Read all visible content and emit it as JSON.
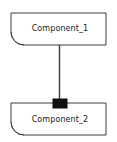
{
  "diagram": {
    "type": "uml-component-diagram",
    "title": "",
    "canvas": {
      "width": 117,
      "height": 142,
      "background": "#ffffff"
    },
    "style": {
      "stroke": "#3d3d3d",
      "stroke_width": 1,
      "fill": "#ffffff",
      "connector_color": "#3d3d3d",
      "port_fill": "#111111",
      "text_color": "#1a1a1a"
    },
    "components": [
      {
        "id": "component_1",
        "label": "Component_1",
        "shape": "rectangle-with-corner-arc",
        "x": 11,
        "y": 13,
        "width": 95,
        "height": 32,
        "label_cx": 60,
        "label_cy": 28,
        "arc_corner": "bottom-left",
        "arc_radius": 13
      },
      {
        "id": "component_2",
        "label": "Component_2",
        "shape": "rectangle-with-corner-arc",
        "x": 11,
        "y": 103,
        "width": 95,
        "height": 32,
        "label_cx": 60,
        "label_cy": 119,
        "arc_corner": "bottom-left",
        "arc_radius": 13
      }
    ],
    "connector": {
      "id": "connector_1",
      "kind": "assembly-connector",
      "from": "component_1",
      "to": "component_2",
      "x": 59.5,
      "y_start": 45,
      "y_end": 103,
      "label": ""
    },
    "port": {
      "id": "port_1",
      "kind": "provided-port-square",
      "owner": "component_2",
      "x": 53,
      "y": 99,
      "width": 14,
      "height": 9,
      "label": ""
    }
  }
}
